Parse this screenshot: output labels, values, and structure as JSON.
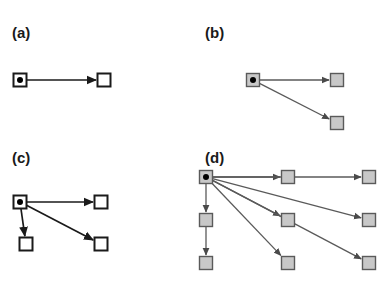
{
  "figure": {
    "width": 387,
    "height": 283,
    "background": "#ffffff",
    "colors": {
      "black_stroke": "#1a1a1a",
      "grey_stroke": "#5a5a5a",
      "grey_fill": "#c8c8c8",
      "white_fill": "#ffffff",
      "root_dot": "#000000"
    },
    "node_size": 13,
    "root_dot_radius": 3
  },
  "panels": [
    {
      "id": "a",
      "label": "(a)",
      "label_pos": {
        "x": 12,
        "y": 38
      },
      "style": "black",
      "nodes": [
        {
          "name": "root",
          "x": 20,
          "y": 80,
          "kind": "root"
        },
        {
          "name": "n1",
          "x": 104,
          "y": 80,
          "kind": "plain"
        }
      ],
      "edges": [
        {
          "from": "root",
          "to": "n1"
        }
      ]
    },
    {
      "id": "b",
      "label": "(b)",
      "label_pos": {
        "x": 205,
        "y": 38
      },
      "style": "grey",
      "nodes": [
        {
          "name": "root",
          "x": 253,
          "y": 80,
          "kind": "root"
        },
        {
          "name": "n1",
          "x": 337,
          "y": 80,
          "kind": "plain"
        },
        {
          "name": "n2",
          "x": 337,
          "y": 123,
          "kind": "plain"
        }
      ],
      "edges": [
        {
          "from": "root",
          "to": "n1"
        },
        {
          "from": "root",
          "to": "n2"
        }
      ]
    },
    {
      "id": "c",
      "label": "(c)",
      "label_pos": {
        "x": 12,
        "y": 163
      },
      "style": "black",
      "nodes": [
        {
          "name": "root",
          "x": 20,
          "y": 202,
          "kind": "root"
        },
        {
          "name": "n1",
          "x": 101,
          "y": 202,
          "kind": "plain"
        },
        {
          "name": "n2",
          "x": 26,
          "y": 244,
          "kind": "plain"
        },
        {
          "name": "n3",
          "x": 101,
          "y": 244,
          "kind": "plain"
        }
      ],
      "edges": [
        {
          "from": "root",
          "to": "n1"
        },
        {
          "from": "root",
          "to": "n2"
        },
        {
          "from": "root",
          "to": "n3"
        }
      ]
    },
    {
      "id": "d",
      "label": "(d)",
      "label_pos": {
        "x": 205,
        "y": 163
      },
      "style": "grey",
      "nodes": [
        {
          "name": "root",
          "x": 206,
          "y": 177,
          "kind": "root"
        },
        {
          "name": "t1",
          "x": 288,
          "y": 177,
          "kind": "plain"
        },
        {
          "name": "t2",
          "x": 369,
          "y": 177,
          "kind": "plain"
        },
        {
          "name": "m1",
          "x": 206,
          "y": 220,
          "kind": "plain"
        },
        {
          "name": "m2",
          "x": 288,
          "y": 220,
          "kind": "plain"
        },
        {
          "name": "m3",
          "x": 369,
          "y": 220,
          "kind": "plain"
        },
        {
          "name": "b1",
          "x": 206,
          "y": 263,
          "kind": "plain"
        },
        {
          "name": "b2",
          "x": 288,
          "y": 263,
          "kind": "plain"
        },
        {
          "name": "b3",
          "x": 369,
          "y": 263,
          "kind": "plain"
        }
      ],
      "edges": [
        {
          "from": "root",
          "to": "t1"
        },
        {
          "from": "root",
          "to": "t2"
        },
        {
          "from": "root",
          "to": "m1"
        },
        {
          "from": "root",
          "to": "m2"
        },
        {
          "from": "root",
          "to": "m3"
        },
        {
          "from": "root",
          "to": "b2"
        },
        {
          "from": "root",
          "to": "b3"
        },
        {
          "from": "m1",
          "to": "b1"
        }
      ]
    }
  ]
}
